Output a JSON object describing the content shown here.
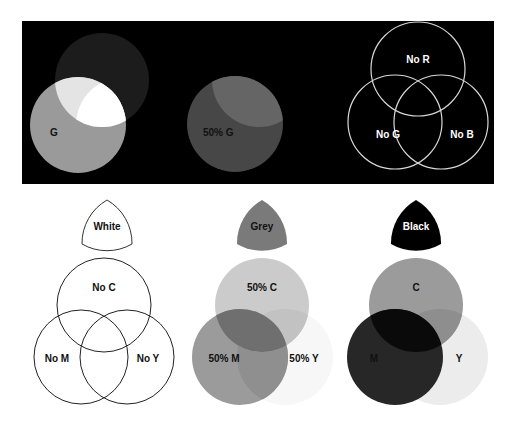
{
  "top_panel": {
    "background": "#000000",
    "diagrams": [
      {
        "id": "rgb-full-green",
        "label_g": "G",
        "colors": {
          "r_only": "#1c1c1c",
          "g_only": "#9a9a9a",
          "r_and_g": "#e4e4e4",
          "r_g_b": "#ffffff"
        }
      },
      {
        "id": "rgb-half-green",
        "label_g": "50% G",
        "colors": {
          "g_only": "#474747",
          "r_and_g": "#656565"
        }
      },
      {
        "id": "rgb-outline",
        "labels": {
          "top": "No R",
          "left": "No G",
          "right": "No B"
        },
        "stroke": "#d8d8d8"
      }
    ]
  },
  "bottom_panel": {
    "background": "#ffffff",
    "swatches": [
      {
        "label": "White",
        "fill": "#ffffff",
        "stroke": "#333333",
        "text_color": "#111111"
      },
      {
        "label": "Grey",
        "fill": "#7a7a7a",
        "stroke": "none",
        "text_color": "#111111"
      },
      {
        "label": "Black",
        "fill": "#000000",
        "stroke": "none",
        "text_color": "#ffffff"
      }
    ],
    "diagrams": [
      {
        "id": "cmy-outline",
        "labels": {
          "top": "No C",
          "left": "No M",
          "right": "No Y"
        },
        "stroke": "#222222"
      },
      {
        "id": "cmy-half",
        "labels": {
          "top": "50% C",
          "left": "50% M",
          "right": "50% Y"
        },
        "colors": {
          "c": "#cbcbcb",
          "m": "#9b9b9b",
          "y": "#f7f7f7",
          "c_and_m": "#6f6f6f",
          "m_and_y": "#8f8f8f",
          "c_and_y": "#c2c2c2"
        }
      },
      {
        "id": "cmy-full",
        "labels": {
          "top": "C",
          "left": "M",
          "right": "Y"
        },
        "colors": {
          "c": "#9b9b9b",
          "m": "#272727",
          "y": "#ececec",
          "c_and_m": "#0a0a0a",
          "c_and_y": "#8e8e8e"
        }
      }
    ]
  }
}
